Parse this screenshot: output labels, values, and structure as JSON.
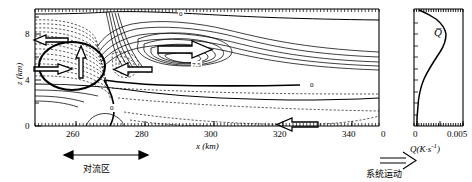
{
  "figure": {
    "title": ""
  },
  "axes": {
    "x": {
      "label": "x (km)",
      "ticks": [
        "260",
        "280",
        "300",
        "320",
        "340"
      ],
      "tick_values": [
        260,
        280,
        300,
        320,
        340
      ],
      "range": [
        248,
        348
      ]
    },
    "y": {
      "label": "z (km)",
      "ticks": [
        "0",
        "4",
        "8"
      ],
      "tick_values": [
        0,
        4,
        8
      ],
      "range": [
        0,
        10.2
      ]
    },
    "profile_x": {
      "label": "Q(K·s",
      "label_sup": "-1",
      "label_close": ")",
      "ticks": [
        "0",
        "0.005"
      ],
      "tick_values": [
        0,
        0.005
      ],
      "range": [
        -0.0005,
        0.0056
      ]
    }
  },
  "annotations": {
    "contour_label_zero_top": "0",
    "contour_label_zero_mid": "0",
    "contour_label_zero_low": "0",
    "contour_label_peak": "7.5",
    "profile_symbol": "Q̅",
    "convective_zone": "对流区",
    "system_motion": "系统运动"
  },
  "chart_data": {
    "type": "line",
    "title": "",
    "xlabel": "x (km)",
    "ylabel": "z (km)",
    "xlim": [
      248,
      348
    ],
    "ylim": [
      0,
      10.2
    ],
    "grid": false,
    "legend": "none",
    "contour_levels_solid": [
      0,
      1.5,
      3.0,
      4.5,
      6.0,
      7.5
    ],
    "contour_levels_dashed": [
      -3.0,
      -2.0,
      -1.0,
      -0.5
    ],
    "contour_zero_label": "0",
    "contour_max_label": "7.5",
    "series": [
      {
        "name": "Q-bar profile",
        "xlabel": "Q(K·s⁻¹)",
        "ylabel": "z (km)",
        "xlim": [
          -0.0005,
          0.0056
        ],
        "ylim": [
          0,
          10.2
        ],
        "z": [
          0.0,
          0.5,
          1.0,
          1.5,
          2.0,
          2.5,
          3.0,
          3.5,
          4.0,
          4.5,
          5.0,
          5.5,
          6.0,
          6.5,
          7.0,
          7.5,
          8.0,
          8.5,
          9.0,
          9.5,
          10.0
        ],
        "values": [
          0.0001,
          0.0002,
          0.00025,
          0.0003,
          0.00035,
          0.0005,
          0.0008,
          0.0014,
          0.0024,
          0.0036,
          0.0046,
          0.005,
          0.0048,
          0.0042,
          0.0033,
          0.0023,
          0.0014,
          0.0008,
          0.0004,
          0.0002,
          0.0001
        ]
      }
    ],
    "flow_arrows": [
      {
        "name": "upper-level-inflow-west",
        "x": 258,
        "z": 8.0,
        "direction": "left"
      },
      {
        "name": "mid-level-inflow-west",
        "x": 257,
        "z": 4.2,
        "direction": "right"
      },
      {
        "name": "updraft",
        "x": 271,
        "z": 5.6,
        "direction": "up"
      },
      {
        "name": "upper-level-outflow-east",
        "x": 298,
        "z": 7.0,
        "direction": "right"
      },
      {
        "name": "rear-inflow-jet",
        "x": 281,
        "z": 4.0,
        "direction": "left"
      },
      {
        "name": "low-level-inflow-east",
        "x": 316,
        "z": 0.2,
        "direction": "left"
      }
    ],
    "highlight_ellipse": {
      "name": "vortex-region",
      "cx": 268,
      "cz": 4.9,
      "rx": 11,
      "rz": 3.2
    }
  }
}
